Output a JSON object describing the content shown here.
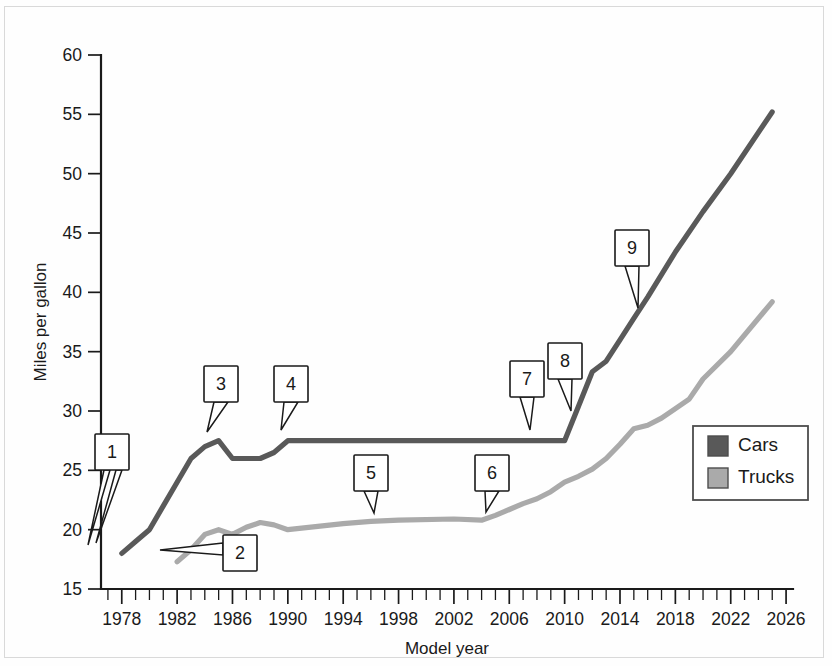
{
  "chart_data": {
    "type": "line",
    "title": "",
    "xlabel": "Model year",
    "ylabel": "Miles per gallon",
    "xlim": [
      1976.5,
      2026.5
    ],
    "ylim": [
      15,
      60
    ],
    "xticks": [
      1978,
      1982,
      1986,
      1990,
      1994,
      1998,
      2002,
      2006,
      2010,
      2014,
      2018,
      2022,
      2026
    ],
    "yticks": [
      15,
      20,
      25,
      30,
      35,
      40,
      45,
      50,
      55,
      60
    ],
    "x_minor_tick_interval": 1,
    "grid": false,
    "legend_position": "right-middle",
    "series": [
      {
        "name": "Cars",
        "color": "#595959",
        "x": [
          1978,
          1979,
          1980,
          1981,
          1982,
          1983,
          1984,
          1985,
          1986,
          1987,
          1988,
          1989,
          1990,
          1994,
          1998,
          2002,
          2006,
          2010,
          2011,
          2012,
          2013,
          2014,
          2015,
          2016,
          2018,
          2020,
          2022,
          2025
        ],
        "values": [
          18.0,
          19.0,
          20.0,
          22.0,
          24.0,
          26.0,
          27.0,
          27.5,
          26.0,
          26.0,
          26.0,
          26.5,
          27.5,
          27.5,
          27.5,
          27.5,
          27.5,
          27.5,
          30.4,
          33.3,
          34.2,
          36.0,
          37.8,
          39.6,
          43.4,
          46.8,
          50.0,
          55.2
        ]
      },
      {
        "name": "Trucks",
        "color": "#aaaaaa",
        "x": [
          1982,
          1983,
          1984,
          1985,
          1986,
          1987,
          1988,
          1989,
          1990,
          1994,
          1996,
          1998,
          2002,
          2004,
          2005,
          2006,
          2007,
          2008,
          2009,
          2010,
          2011,
          2012,
          2013,
          2014,
          2015,
          2016,
          2017,
          2018,
          2019,
          2020,
          2022,
          2025
        ]
      }
    ]
  },
  "series_values": {
    "trucks": [
      17.3,
      18.3,
      19.6,
      20.0,
      19.6,
      20.2,
      20.6,
      20.4,
      20.0,
      20.5,
      20.7,
      20.8,
      20.9,
      20.8,
      21.2,
      21.7,
      22.2,
      22.6,
      23.2,
      24.0,
      24.5,
      25.1,
      26.0,
      27.2,
      28.5,
      28.8,
      29.4,
      30.2,
      31.0,
      32.7,
      35.0,
      39.2
    ]
  },
  "legend": {
    "items": [
      {
        "label": "Cars",
        "color": "#595959"
      },
      {
        "label": "Trucks",
        "color": "#aaaaaa"
      }
    ]
  },
  "callouts": [
    {
      "id": "1",
      "label": "1",
      "box_x": 112,
      "box_y": 434,
      "tip1_x": 88,
      "tip1_y": 545,
      "tip2_x": 96,
      "tip2_y": 543
    },
    {
      "id": "2",
      "label": "2",
      "box_x": 240,
      "box_y": 535,
      "tip_x": 160,
      "tip_y": 550
    },
    {
      "id": "3",
      "label": "3",
      "box_x": 221,
      "box_y": 366,
      "tip_x": 207,
      "tip_y": 432
    },
    {
      "id": "4",
      "label": "4",
      "box_x": 291,
      "box_y": 366,
      "tip_x": 281,
      "tip_y": 430
    },
    {
      "id": "5",
      "label": "5",
      "box_x": 371,
      "box_y": 455,
      "tip_x": 374,
      "tip_y": 513
    },
    {
      "id": "6",
      "label": "6",
      "box_x": 492,
      "box_y": 455,
      "tip_x": 486,
      "tip_y": 512
    },
    {
      "id": "7",
      "label": "7",
      "box_x": 527,
      "box_y": 361,
      "tip_x": 530,
      "tip_y": 430
    },
    {
      "id": "8",
      "label": "8",
      "box_x": 565,
      "box_y": 343,
      "tip_x": 571,
      "tip_y": 411
    },
    {
      "id": "9",
      "label": "9",
      "box_x": 632,
      "box_y": 230,
      "tip_x": 638,
      "tip_y": 308
    }
  ],
  "colors": {
    "cars": "#595959",
    "trucks": "#aaaaaa",
    "axis": "#1a1a1a",
    "background": "#fefefe",
    "frame": "#d9d9d9"
  }
}
